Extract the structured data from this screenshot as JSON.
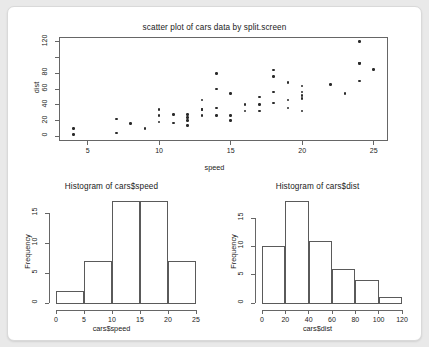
{
  "device": {
    "background": "#ffffff",
    "page_background": "#e9e9e9",
    "point_color": "#2b2b2b",
    "axis_color": "#666666"
  },
  "chart_data": [
    {
      "type": "scatter",
      "title": "scatter plot of cars data by split.screen",
      "xlabel": "speed",
      "ylabel": "dist",
      "xlim": [
        3.0,
        26.0
      ],
      "ylim": [
        -6,
        126
      ],
      "xticks": [
        5,
        10,
        15,
        20,
        25
      ],
      "yticks": [
        0,
        20,
        40,
        60,
        80,
        100,
        120
      ],
      "ytick_labels": [
        "0",
        "20",
        "40",
        "60",
        "80",
        "",
        "120"
      ],
      "grid": false,
      "legend": "none",
      "x": [
        4,
        4,
        7,
        7,
        8,
        9,
        10,
        10,
        10,
        11,
        11,
        12,
        12,
        12,
        12,
        13,
        13,
        13,
        13,
        14,
        14,
        14,
        14,
        15,
        15,
        15,
        16,
        16,
        17,
        17,
        17,
        18,
        18,
        18,
        18,
        19,
        19,
        19,
        20,
        20,
        20,
        20,
        20,
        22,
        23,
        24,
        24,
        24,
        24,
        25
      ],
      "y": [
        2,
        10,
        4,
        22,
        16,
        10,
        18,
        26,
        34,
        17,
        28,
        14,
        20,
        24,
        28,
        26,
        34,
        34,
        46,
        26,
        36,
        60,
        80,
        20,
        26,
        54,
        32,
        40,
        32,
        40,
        50,
        42,
        56,
        76,
        84,
        36,
        46,
        68,
        32,
        48,
        52,
        56,
        64,
        66,
        54,
        70,
        92,
        93,
        120,
        85
      ]
    },
    {
      "type": "bar",
      "title": "Histogram of cars$speed",
      "xlabel": "cars$speed",
      "ylabel": "Frequency",
      "xlim": [
        0,
        25
      ],
      "ylim": [
        0,
        17
      ],
      "xticks": [
        0,
        5,
        10,
        15,
        20,
        25
      ],
      "yticks": [
        0,
        5,
        10,
        15
      ],
      "grid": false,
      "legend": "none",
      "bin_edges": [
        0,
        5,
        10,
        15,
        20,
        25
      ],
      "categories": [
        "0-5",
        "5-10",
        "10-15",
        "15-20",
        "20-25"
      ],
      "values": [
        2,
        7,
        17,
        17,
        7
      ]
    },
    {
      "type": "bar",
      "title": "Histogram of cars$dist",
      "xlabel": "cars$dist",
      "ylabel": "Frequency",
      "xlim": [
        0,
        120
      ],
      "ylim": [
        0,
        18
      ],
      "xticks": [
        0,
        20,
        40,
        60,
        80,
        100,
        120
      ],
      "yticks": [
        0,
        5,
        10,
        15
      ],
      "grid": false,
      "legend": "none",
      "bin_edges": [
        0,
        20,
        40,
        60,
        80,
        100,
        120
      ],
      "categories": [
        "0-20",
        "20-40",
        "40-60",
        "60-80",
        "80-100",
        "100-120"
      ],
      "values": [
        10,
        18,
        11,
        6,
        4,
        1
      ]
    }
  ]
}
